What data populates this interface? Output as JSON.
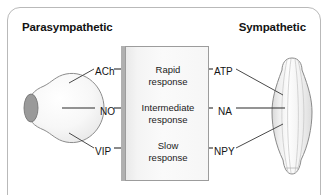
{
  "figure": {
    "headings": {
      "left": "Parasympathetic",
      "right": "Sympathetic"
    },
    "left_cell": {
      "name": "neuron-cell-body",
      "description": "parasympathetic neuron cell body"
    },
    "right_cell": {
      "name": "smooth-muscle-cell",
      "description": "spindle shaped smooth muscle cell"
    },
    "response_box": {
      "rows": [
        {
          "id": "rapid",
          "line1": "Rapid",
          "line2": "response"
        },
        {
          "id": "intermediate",
          "line1": "Intermediate",
          "line2": "response"
        },
        {
          "id": "slow",
          "line1": "Slow",
          "line2": "response"
        }
      ]
    },
    "transmitters": {
      "parasympathetic": [
        {
          "id": "ach",
          "label": "ACh",
          "response": "Rapid response"
        },
        {
          "id": "no",
          "label": "NO",
          "response": "Intermediate response"
        },
        {
          "id": "vip",
          "label": "VIP",
          "response": "Slow response"
        }
      ],
      "sympathetic": [
        {
          "id": "atp",
          "label": "ATP",
          "response": "Rapid response"
        },
        {
          "id": "na",
          "label": "NA",
          "response": "Intermediate response"
        },
        {
          "id": "npy",
          "label": "NPY",
          "response": "Slow response"
        }
      ]
    },
    "colors": {
      "frame_border": "#b9b9b9",
      "box_border": "#9c9c9c",
      "box_fill": "#f6f6f6",
      "box_shadow": "#b0b0b0",
      "text": "#141414",
      "leader_line": "#2b2b2b",
      "cell_outline": "#8a8a8a"
    }
  }
}
